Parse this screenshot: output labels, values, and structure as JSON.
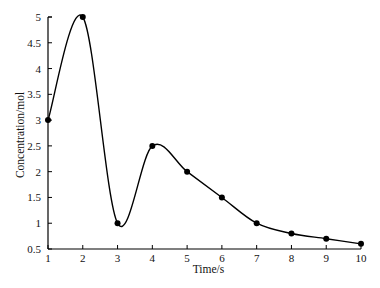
{
  "chart_data": {
    "type": "line",
    "title": "",
    "xlabel": "Time/s",
    "ylabel": "Concentration/mol",
    "x": [
      1,
      2,
      3,
      4,
      5,
      6,
      7,
      8,
      9,
      10
    ],
    "series": [
      {
        "name": "Concentration",
        "values": [
          3,
          5,
          1,
          2.5,
          2,
          1.5,
          1,
          0.8,
          0.7,
          0.6
        ]
      }
    ],
    "xlim": [
      1,
      10
    ],
    "ylim": [
      0.5,
      5
    ],
    "xticks": [
      "1",
      "2",
      "3",
      "4",
      "5",
      "6",
      "7",
      "8",
      "9",
      "10"
    ],
    "yticks": [
      "0.5",
      "1",
      "1.5",
      "2",
      "2.5",
      "3",
      "3.5",
      "4",
      "4.5",
      "5"
    ],
    "grid": false,
    "legend": "none",
    "line_style": "smooth curve with filled circular markers",
    "color": "#000000"
  }
}
